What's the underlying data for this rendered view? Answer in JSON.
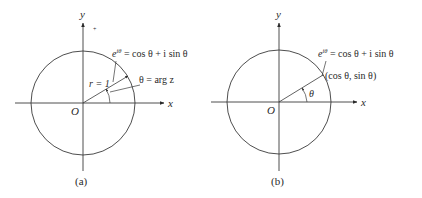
{
  "figure": {
    "panels": [
      {
        "id": "a",
        "caption": "(a)",
        "axis_x_label": "x",
        "axis_y_label": "y",
        "origin_label": "O",
        "radius_label": "r = 1",
        "point_formula": {
          "base": "e",
          "exponent": "iθ",
          "rest": " = cos θ + i sin θ"
        },
        "angle_label": "θ = arg z"
      },
      {
        "id": "b",
        "caption": "(b)",
        "axis_x_label": "x",
        "axis_y_label": "y",
        "origin_label": "O",
        "point_formula": {
          "base": "e",
          "exponent": "iθ",
          "rest": " = cos θ + i sin θ"
        },
        "point_coords": "(cos θ, sin θ)",
        "angle_label": "θ"
      }
    ],
    "colors": {
      "ink": "#3a3a3a",
      "background": "#ffffff"
    }
  }
}
